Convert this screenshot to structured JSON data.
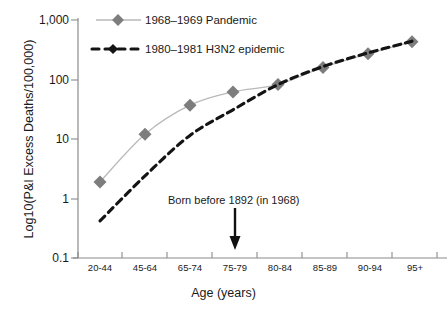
{
  "chart_data": {
    "type": "line",
    "title": "",
    "xlabel": "Age (years)",
    "ylabel": "Log10(P&I Excess Deaths/100,000)",
    "categories": [
      "20-44",
      "45-64",
      "65-74",
      "75-79",
      "80-84",
      "85-89",
      "90-94",
      "95+"
    ],
    "yscale": "log",
    "ylim": [
      0.1,
      1000
    ],
    "yticks": [
      "1,000",
      "100",
      "10",
      "1",
      "0.1"
    ],
    "ytick_values": [
      1000,
      100,
      10,
      1,
      0.1
    ],
    "grid": false,
    "legend_position": "top-left",
    "series": [
      {
        "name": "1968–1969 Pandemic",
        "values": [
          1.9,
          12,
          37,
          62,
          82,
          160,
          270,
          430
        ],
        "color": "#808080",
        "line_style": "solid",
        "marker": "diamond"
      },
      {
        "name": "1980–1981 H3N2 epidemic",
        "values": [
          0.42,
          2.4,
          11.5,
          31,
          82,
          165,
          280,
          440
        ],
        "color": "#111111",
        "line_style": "dashed",
        "marker": "none"
      }
    ],
    "annotations": [
      {
        "text": "Born before 1892 (in 1968)",
        "category": "75-79",
        "arrow": "down"
      }
    ]
  },
  "legend": {
    "items": [
      {
        "label": "1968–1969 Pandemic"
      },
      {
        "label": "1980–1981 H3N2 epidemic"
      }
    ]
  },
  "axes": {
    "y_title": "Log10(P&I Excess Deaths/100,000)",
    "x_title": "Age (years)",
    "y_ticks": [
      "1,000",
      "100",
      "10",
      "1",
      "0.1"
    ],
    "x_ticks": [
      "20-44",
      "45-64",
      "65-74",
      "75-79",
      "80-84",
      "85-89",
      "90-94",
      "95+"
    ]
  },
  "annotation": {
    "text": "Born before 1892 (in 1968)"
  },
  "colors": {
    "pandemic": "#808080",
    "h3n2": "#111111",
    "axis": "#6e6e6e",
    "background": "#ffffff"
  }
}
